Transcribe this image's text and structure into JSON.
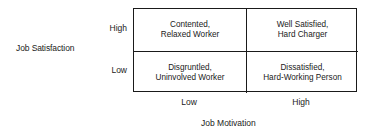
{
  "diagram": {
    "type": "2x2 matrix",
    "y_axis": {
      "label": "Job Satisfaction",
      "ticks": [
        "High",
        "Low"
      ]
    },
    "x_axis": {
      "label": "Job Motivation",
      "ticks": [
        "Low",
        "High"
      ]
    },
    "cells": {
      "high_sat_low_mot": {
        "line1": "Contented,",
        "line2": "Relaxed Worker"
      },
      "high_sat_high_mot": {
        "line1": "Well Satisfied,",
        "line2": "Hard Charger"
      },
      "low_sat_low_mot": {
        "line1": "Disgruntled,",
        "line2": "Uninvolved Worker"
      },
      "low_sat_high_mot": {
        "line1": "Dissatisfied,",
        "line2": "Hard-Working Person"
      }
    }
  }
}
